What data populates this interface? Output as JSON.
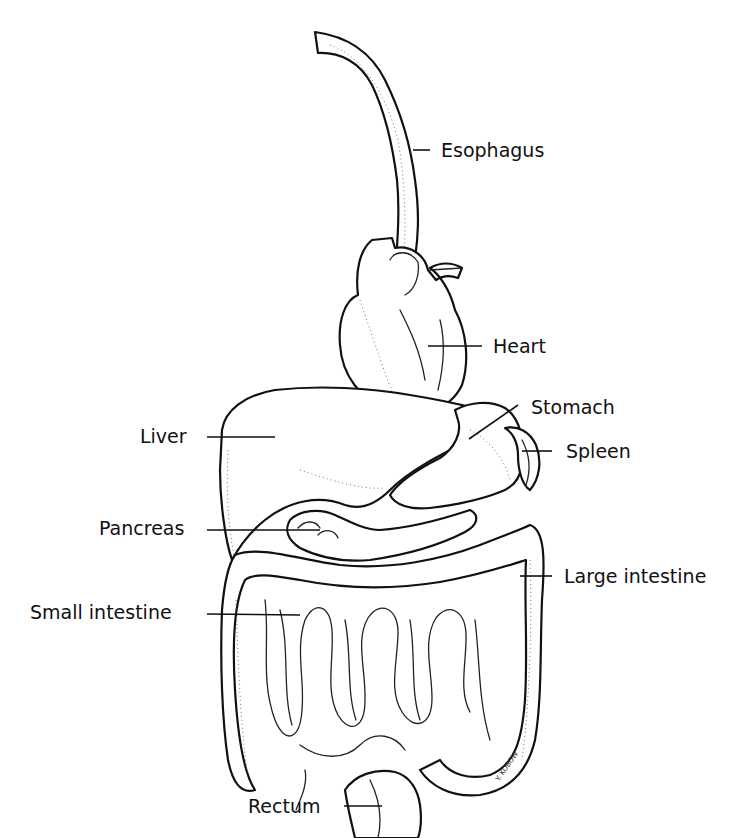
{
  "diagram": {
    "type": "anatomical line drawing",
    "labels": [
      {
        "id": "esophagus",
        "text": "Esophagus"
      },
      {
        "id": "heart",
        "text": "Heart"
      },
      {
        "id": "stomach",
        "text": "Stomach"
      },
      {
        "id": "liver",
        "text": "Liver"
      },
      {
        "id": "spleen",
        "text": "Spleen"
      },
      {
        "id": "pancreas",
        "text": "Pancreas"
      },
      {
        "id": "large_intestine",
        "text": "Large intestine"
      },
      {
        "id": "small_intestine",
        "text": "Small intestine"
      },
      {
        "id": "rectum",
        "text": "Rectum"
      }
    ],
    "signature": "Y. KOBOW"
  }
}
